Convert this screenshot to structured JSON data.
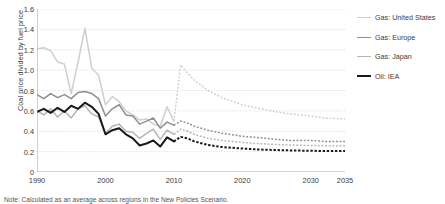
{
  "note": "Note: Calculated as an average across regions in the New Policies Scenario.",
  "chart_data": {
    "type": "line",
    "title": "",
    "xlabel": "",
    "ylabel": "Coal price divided by fuel price",
    "xlim": [
      1990,
      2035
    ],
    "ylim": [
      0,
      1.6
    ],
    "ytick_values": [
      0,
      0.2,
      0.4,
      0.6,
      0.8,
      1.0,
      1.2,
      1.4,
      1.6
    ],
    "ytick_labels": [
      "0",
      "0.2",
      "0.4",
      "0.6",
      "0.8",
      "1.0",
      "1.2",
      "1.4",
      "1.6"
    ],
    "xtick_values": [
      1990,
      2000,
      2010,
      2020,
      2030,
      2035
    ],
    "xtick_labels": [
      "1990",
      "2000",
      "2010",
      "2020",
      "2030",
      "2035"
    ],
    "xminor_values": [
      1995,
      2005,
      2015,
      2025
    ],
    "grid": "horizontal-dotted",
    "legend_position": "right",
    "projection_start": 2010,
    "series": [
      {
        "name": "Gas: United States",
        "color": "#cfcfcf",
        "width": 1.5,
        "x": [
          1990,
          1991,
          1992,
          1993,
          1994,
          1995,
          1996,
          1997,
          1998,
          1999,
          2000,
          2001,
          2002,
          2003,
          2004,
          2005,
          2006,
          2007,
          2008,
          2009,
          2010
        ],
        "values": [
          1.21,
          1.22,
          1.19,
          1.08,
          1.06,
          0.77,
          1.08,
          1.41,
          1.02,
          0.95,
          0.66,
          0.74,
          0.69,
          0.6,
          0.56,
          0.51,
          0.52,
          0.47,
          0.45,
          0.64,
          0.5
        ],
        "projection_x": [
          2010,
          2011,
          2012,
          2013,
          2015,
          2017,
          2020,
          2022,
          2025,
          2027,
          2030,
          2032,
          2035
        ],
        "projection_values": [
          0.5,
          1.05,
          0.97,
          0.9,
          0.8,
          0.73,
          0.66,
          0.63,
          0.59,
          0.57,
          0.55,
          0.53,
          0.52
        ]
      },
      {
        "name": "Gas: Europe",
        "color": "#8f8f8f",
        "width": 1.5,
        "x": [
          1990,
          1991,
          1992,
          1993,
          1994,
          1995,
          1996,
          1997,
          1998,
          1999,
          2000,
          2001,
          2002,
          2003,
          2004,
          2005,
          2006,
          2007,
          2008,
          2009,
          2010
        ],
        "values": [
          0.76,
          0.72,
          0.77,
          0.73,
          0.76,
          0.72,
          0.78,
          0.79,
          0.77,
          0.72,
          0.55,
          0.62,
          0.66,
          0.56,
          0.55,
          0.47,
          0.5,
          0.53,
          0.43,
          0.49,
          0.46
        ],
        "projection_x": [
          2010,
          2011,
          2012,
          2013,
          2015,
          2017,
          2020,
          2022,
          2025,
          2027,
          2030,
          2032,
          2035
        ],
        "projection_values": [
          0.46,
          0.5,
          0.48,
          0.45,
          0.41,
          0.38,
          0.35,
          0.34,
          0.32,
          0.31,
          0.31,
          0.3,
          0.3
        ]
      },
      {
        "name": "Gas: Japan",
        "color": "#b5b5b5",
        "width": 1.5,
        "x": [
          1990,
          1991,
          1992,
          1993,
          1994,
          1995,
          1996,
          1997,
          1998,
          1999,
          2000,
          2001,
          2002,
          2003,
          2004,
          2005,
          2006,
          2007,
          2008,
          2009,
          2010
        ],
        "values": [
          0.6,
          0.56,
          0.62,
          0.54,
          0.6,
          0.53,
          0.62,
          0.65,
          0.57,
          0.54,
          0.38,
          0.45,
          0.47,
          0.4,
          0.39,
          0.33,
          0.38,
          0.42,
          0.32,
          0.41,
          0.37
        ],
        "projection_x": [
          2010,
          2011,
          2012,
          2013,
          2015,
          2017,
          2020,
          2022,
          2025,
          2027,
          2030,
          2032,
          2035
        ],
        "projection_values": [
          0.37,
          0.42,
          0.4,
          0.37,
          0.33,
          0.31,
          0.29,
          0.28,
          0.27,
          0.265,
          0.26,
          0.258,
          0.255
        ]
      },
      {
        "name": "Oil: IEA",
        "color": "#1a1a1a",
        "width": 2.0,
        "x": [
          1990,
          1991,
          1992,
          1993,
          1994,
          1995,
          1996,
          1997,
          1998,
          1999,
          2000,
          2001,
          2002,
          2003,
          2004,
          2005,
          2006,
          2007,
          2008,
          2009,
          2010
        ],
        "values": [
          0.59,
          0.62,
          0.58,
          0.63,
          0.59,
          0.65,
          0.62,
          0.68,
          0.64,
          0.57,
          0.37,
          0.41,
          0.43,
          0.37,
          0.33,
          0.26,
          0.28,
          0.31,
          0.25,
          0.34,
          0.3
        ],
        "projection_x": [
          2010,
          2011,
          2012,
          2013,
          2015,
          2017,
          2020,
          2022,
          2025,
          2027,
          2030,
          2032,
          2035
        ],
        "projection_values": [
          0.3,
          0.345,
          0.33,
          0.3,
          0.265,
          0.245,
          0.23,
          0.222,
          0.215,
          0.212,
          0.208,
          0.206,
          0.205
        ]
      }
    ]
  },
  "legend": {
    "items": [
      {
        "label": "Gas: United States",
        "color": "#cfcfcf",
        "width": 1.5
      },
      {
        "label": "Gas: Europe",
        "color": "#8f8f8f",
        "width": 1.5
      },
      {
        "label": "Gas: Japan",
        "color": "#b5b5b5",
        "width": 1.5
      },
      {
        "label": "Oil: IEA",
        "color": "#1a1a1a",
        "width": 2.2
      }
    ]
  }
}
